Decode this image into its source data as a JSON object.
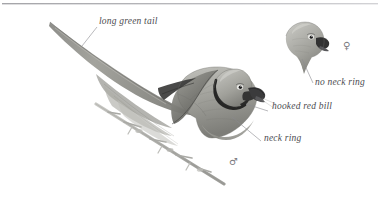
{
  "plate": {
    "title": "Parakeet identification plate",
    "style": "grayscale watercolour field-guide illustration",
    "background_color": "#ffffff",
    "ink_color": "#4b4b4f",
    "rule_color": "#9a9a9e",
    "top_rule": true
  },
  "labels": [
    {
      "id": "long-green-tail",
      "text": "long green tail",
      "x": 99,
      "y": 22,
      "leader": {
        "x1": 97,
        "y1": 27,
        "x2": 82,
        "y2": 46
      }
    },
    {
      "id": "hooked-red-bill",
      "text": "hooked red bill",
      "x": 272,
      "y": 107,
      "leader": {
        "x1": 268,
        "y1": 111,
        "x2": 246,
        "y2": 104
      }
    },
    {
      "id": "neck-ring",
      "text": "neck ring",
      "x": 264,
      "y": 139,
      "leader": {
        "x1": 261,
        "y1": 141,
        "x2": 232,
        "y2": 117
      }
    },
    {
      "id": "no-neck-ring",
      "text": "no neck ring",
      "x": 315,
      "y": 83,
      "leader": {
        "x1": 313,
        "y1": 83,
        "x2": 302,
        "y2": 59
      }
    }
  ],
  "sex_symbols": [
    {
      "id": "male",
      "glyph": "♂",
      "x": 229,
      "y": 160,
      "subject": "full-bird-male"
    },
    {
      "id": "female",
      "glyph": "♀",
      "x": 343,
      "y": 45,
      "subject": "head-female"
    }
  ],
  "subjects": [
    {
      "id": "full-bird-male",
      "name": "male parakeet, perched, long tail"
    },
    {
      "id": "head-female",
      "name": "female parakeet head"
    },
    {
      "id": "perch-branch",
      "name": "branch perch"
    }
  ],
  "palette": {
    "body_light": "#b9b9b4",
    "body_mid": "#94948e",
    "body_dark": "#6d6d69",
    "wing_dark": "#4a4a48",
    "collar_black": "#2b2b2b",
    "bill_dark": "#39393a",
    "branch": "#a9a9a4",
    "outline": "#74747a"
  }
}
